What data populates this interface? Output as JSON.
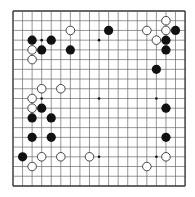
{
  "board": {
    "size": 19,
    "origin_x": 13,
    "origin_y": 11,
    "spacing_x": 9.56,
    "spacing_y": 9.72,
    "line_color": "#6a6a6a",
    "border_color": "#333333",
    "background": "#ffffff",
    "stone_radius": 4.6,
    "star_points": [
      [
        3,
        3
      ],
      [
        9,
        3
      ],
      [
        15,
        3
      ],
      [
        3,
        9
      ],
      [
        9,
        9
      ],
      [
        15,
        9
      ],
      [
        3,
        15
      ],
      [
        9,
        15
      ],
      [
        15,
        15
      ]
    ]
  },
  "stones": {
    "black": [
      [
        2,
        3
      ],
      [
        4,
        3
      ],
      [
        3,
        4
      ],
      [
        6,
        4
      ],
      [
        10,
        2
      ],
      [
        17,
        2
      ],
      [
        16,
        3
      ],
      [
        16,
        4
      ],
      [
        15,
        6
      ],
      [
        3,
        10
      ],
      [
        2,
        11
      ],
      [
        4,
        11
      ],
      [
        2,
        13
      ],
      [
        4,
        13
      ],
      [
        1,
        15
      ],
      [
        16,
        10
      ],
      [
        16,
        13
      ]
    ],
    "white": [
      [
        6,
        2
      ],
      [
        2,
        4
      ],
      [
        2,
        5
      ],
      [
        16,
        1
      ],
      [
        14,
        2
      ],
      [
        16,
        2
      ],
      [
        15,
        3
      ],
      [
        3,
        8
      ],
      [
        5,
        8
      ],
      [
        2,
        9
      ],
      [
        2,
        10
      ],
      [
        3,
        15
      ],
      [
        5,
        15
      ],
      [
        8,
        15
      ],
      [
        2,
        16
      ],
      [
        16,
        15
      ],
      [
        14,
        16
      ]
    ]
  },
  "colors": {
    "black_stone": "#111111",
    "white_stone_fill": "#ffffff",
    "white_stone_stroke": "#333333"
  }
}
